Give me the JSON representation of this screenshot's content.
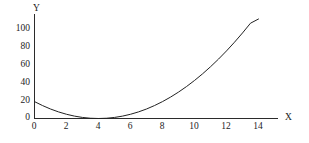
{
  "chart_data": {
    "type": "line",
    "title": "",
    "subtitle": "",
    "xlabel": "X",
    "ylabel": "Y",
    "xlim": [
      0,
      15.4
    ],
    "ylim": [
      0,
      117
    ],
    "grid": false,
    "legend": null,
    "annotations": [],
    "xticks": [
      0,
      2,
      4,
      6,
      8,
      10,
      12,
      14
    ],
    "xtick_labels": [
      "0",
      "2",
      "4",
      "6",
      "8",
      "10",
      "12",
      "14"
    ],
    "yticks": [
      0,
      20,
      40,
      60,
      80,
      100
    ],
    "ytick_labels": [
      "0",
      "20",
      "40",
      "60",
      "80",
      "100"
    ],
    "series": [
      {
        "name": "parabola",
        "color": "#222222",
        "equation": "y = 1.2 (x - 4)^2",
        "x": [
          0,
          0.5,
          1,
          1.5,
          2,
          2.5,
          3,
          3.5,
          4,
          4.5,
          5,
          5.5,
          6,
          6.5,
          7,
          7.5,
          8,
          8.5,
          9,
          9.5,
          10,
          10.5,
          11,
          11.5,
          12,
          12.5,
          13,
          13.5,
          14
        ],
        "values": [
          19.2,
          14.7,
          10.8,
          7.5,
          4.8,
          2.7,
          1.2,
          0.3,
          0,
          0.3,
          1.2,
          2.7,
          4.8,
          7.5,
          10.8,
          14.7,
          19.2,
          24.3,
          30,
          36.3,
          43.2,
          50.7,
          58.8,
          67.5,
          76.8,
          86.7,
          97.2,
          108.3,
          120
        ]
      }
    ]
  },
  "axes": {
    "y_title": "Y",
    "x_title": "X"
  }
}
